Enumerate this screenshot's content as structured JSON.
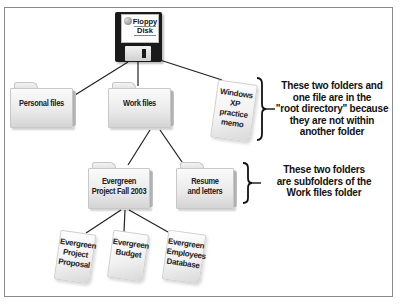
{
  "diagram": {
    "root": {
      "label_line1": "Floppy",
      "label_line2": "Disk",
      "icon": "floppy-disk-icon"
    },
    "root_children": [
      {
        "type": "folder",
        "label": "Personal files"
      },
      {
        "type": "folder",
        "label": "Work files"
      },
      {
        "type": "file",
        "lines": [
          "Windows",
          "XP",
          "practice",
          "memo"
        ]
      }
    ],
    "work_files_children": [
      {
        "type": "folder",
        "lines": [
          "Evergreen",
          "Project Fall 2003"
        ]
      },
      {
        "type": "folder",
        "lines": [
          "Resume",
          "and letters"
        ]
      }
    ],
    "evergreen_children": [
      {
        "type": "file",
        "lines": [
          "Evergreen",
          "Project",
          "Proposal"
        ]
      },
      {
        "type": "file",
        "lines": [
          "Evergreen",
          "Budget"
        ]
      },
      {
        "type": "file",
        "lines": [
          "Evergreen",
          "Employees",
          "Database"
        ]
      }
    ],
    "annotations": [
      {
        "lines": [
          "These two folders and",
          "one file are in the",
          "\"root directory\" because",
          "they are not within",
          "another folder"
        ]
      },
      {
        "lines": [
          "These two folders",
          "are subfolders of the",
          "Work files folder"
        ]
      }
    ]
  },
  "colors": {
    "border": "#8a8a8a",
    "line": "#222222",
    "text": "#111111",
    "floppy": "#1a1a1a"
  }
}
